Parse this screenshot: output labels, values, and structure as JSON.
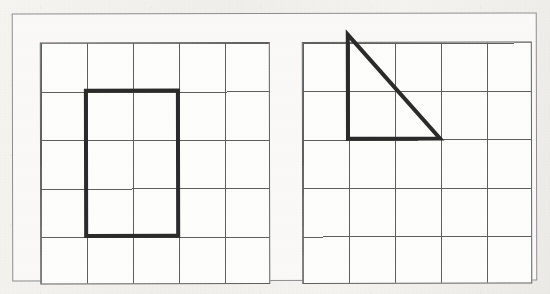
{
  "document": {
    "kind": "scanned-geometry-worksheet-figure",
    "background_color": "#f1efec",
    "paper_color": "#faf9f7",
    "frame_color": "#8d8d8d"
  },
  "figure": {
    "grid_line_color": "#5f5f5f",
    "shape_line_color": "#2b2b2b",
    "shape_line_width": 4,
    "panels": [
      {
        "name": "rectangle-panel",
        "position": "left",
        "grid": {
          "columns": 5,
          "rows": 5,
          "cell_width": 46,
          "cell_height": 48.4
        },
        "shape": {
          "name": "rectangle",
          "type": "rectangle",
          "width_cells": 2,
          "height_cells": 3,
          "area_cells": 6,
          "perimeter_cells": 10,
          "origin_cell_col": 2,
          "origin_cell_row": 2,
          "vertices": [
            [
              1,
              1
            ],
            [
              3,
              1
            ],
            [
              3,
              4
            ],
            [
              1,
              4
            ]
          ]
        }
      },
      {
        "name": "triangle-panel",
        "position": "right",
        "grid": {
          "columns": 5,
          "rows": 5,
          "cell_width": 46,
          "cell_height": 48.4
        },
        "shape": {
          "name": "right-triangle",
          "type": "triangle",
          "base_cells": 2,
          "height_cells": 2,
          "area_cells": 2,
          "origin_cell_col": 2,
          "origin_cell_row": 1,
          "vertices": [
            [
              1,
              -0.15
            ],
            [
              1,
              2
            ],
            [
              3,
              2
            ]
          ]
        }
      }
    ]
  }
}
